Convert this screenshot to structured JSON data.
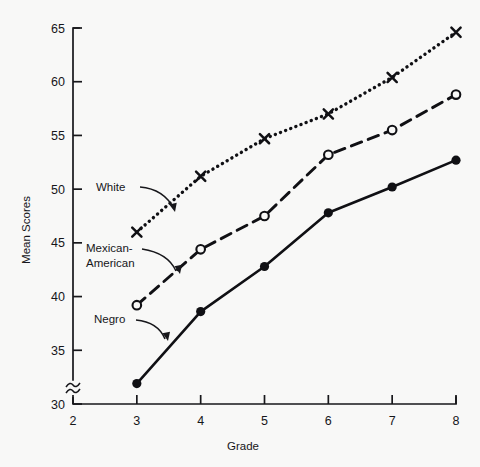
{
  "chart_data": {
    "type": "line",
    "title": "",
    "xlabel": "Grade",
    "ylabel": "Mean Scores",
    "x": [
      3,
      4,
      5,
      6,
      7,
      8
    ],
    "xticks": [
      2,
      3,
      4,
      5,
      6,
      7,
      8
    ],
    "xtick_labels": [
      "2",
      "3",
      "4",
      "5",
      "6",
      "7",
      "8"
    ],
    "xlim": [
      2,
      8
    ],
    "yticks": [
      30,
      35,
      40,
      45,
      50,
      55,
      60,
      65
    ],
    "ytick_labels": [
      "30",
      "35",
      "40",
      "45",
      "50",
      "55",
      "60",
      "65"
    ],
    "ylim": [
      30,
      65
    ],
    "y_axis_break": true,
    "y_axis_break_symbol": "≈",
    "grid": false,
    "legend_position": "inline-annotations",
    "series": [
      {
        "name": "White",
        "marker": "x",
        "linestyle": "dotted",
        "color": "#101014",
        "values": [
          46.0,
          51.2,
          54.7,
          57.0,
          60.4,
          64.6
        ]
      },
      {
        "name": "Mexican-American",
        "marker": "open-circle",
        "linestyle": "dashed",
        "color": "#101014",
        "values": [
          39.2,
          44.4,
          47.5,
          53.2,
          55.5,
          58.8
        ]
      },
      {
        "name": "Negro",
        "marker": "filled-circle",
        "linestyle": "solid",
        "color": "#101014",
        "values": [
          31.9,
          38.6,
          42.8,
          47.8,
          50.2,
          52.7
        ]
      }
    ],
    "annotations": [
      {
        "text": "White",
        "series": "White"
      },
      {
        "text_line1": "Mexican-",
        "text_line2": "American",
        "series": "Mexican-American"
      },
      {
        "text": "Negro",
        "series": "Negro"
      }
    ]
  },
  "colors": {
    "background": "#f8f8f7",
    "ink": "#17171b"
  }
}
